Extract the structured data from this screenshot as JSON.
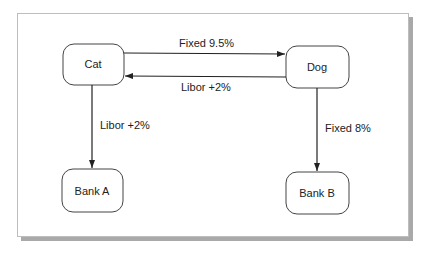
{
  "diagram": {
    "nodes": [
      {
        "id": "cat",
        "label": "Cat"
      },
      {
        "id": "dog",
        "label": "Dog"
      },
      {
        "id": "bank_a",
        "label": "Bank A"
      },
      {
        "id": "bank_b",
        "label": "Bank B"
      }
    ],
    "edges": [
      {
        "from": "cat",
        "to": "dog",
        "label": "Fixed 9.5%"
      },
      {
        "from": "dog",
        "to": "cat",
        "label": "Libor +2%"
      },
      {
        "from": "cat",
        "to": "bank_a",
        "label": "Libor +2%"
      },
      {
        "from": "dog",
        "to": "bank_b",
        "label": "Fixed 8%"
      }
    ],
    "colors": {
      "stroke": "#222222",
      "frame_shadow": "#a9a9a9"
    }
  }
}
